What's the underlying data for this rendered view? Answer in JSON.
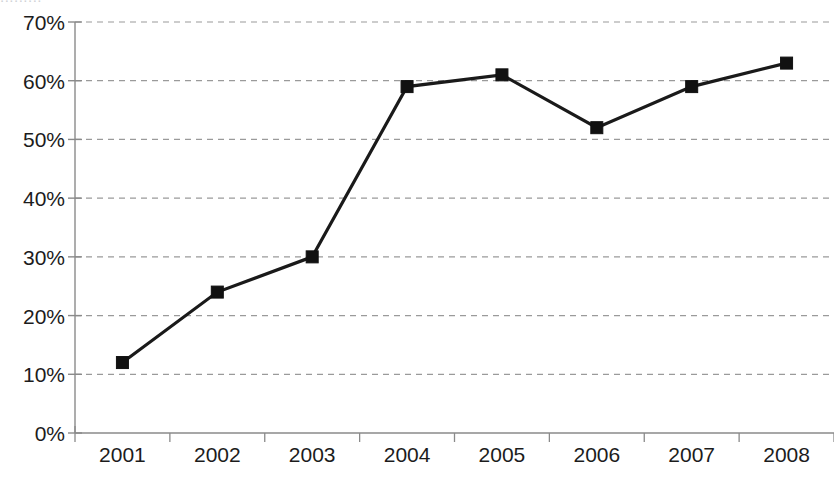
{
  "chart_data": {
    "type": "line",
    "title": "",
    "xlabel": "",
    "ylabel": "",
    "categories": [
      "2001",
      "2002",
      "2003",
      "2004",
      "2005",
      "2006",
      "2007",
      "2008"
    ],
    "values": [
      12,
      24,
      30,
      59,
      61,
      52,
      59,
      63
    ],
    "value_labels": [
      "12%",
      "24%",
      "30%",
      "59%",
      "61%",
      "52%",
      "59%",
      "63%"
    ],
    "ylim": [
      0,
      70
    ],
    "ytick_values": [
      0,
      10,
      20,
      30,
      40,
      50,
      60,
      70
    ],
    "ytick_labels": [
      "0%",
      "10%",
      "20%",
      "30%",
      "40%",
      "50%",
      "60%",
      "70%"
    ],
    "grid": true,
    "grid_axis": "y",
    "grid_style": "dashed",
    "legend": "none",
    "series": [
      {
        "name": "",
        "values": [
          12,
          24,
          30,
          59,
          61,
          52,
          59,
          63
        ],
        "marker": "square",
        "line_color": "#1a1a1a",
        "marker_color": "#111111"
      }
    ],
    "colors": {
      "line": "#1a1a1a",
      "marker": "#111111",
      "grid": "#9a9a9a",
      "axis": "#8a8a8a",
      "text": "#1c1c1c",
      "background": "#ffffff"
    }
  },
  "clipped_header": {
    "text": "........."
  }
}
